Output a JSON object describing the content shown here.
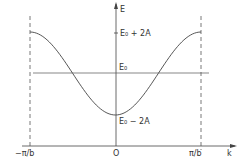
{
  "diagram": {
    "type": "energy-band-dispersion",
    "axes": {
      "y_label": "E",
      "x_label": "k",
      "origin_label": "O",
      "x_ticks": [
        "−π/b",
        "π/b"
      ]
    },
    "levels": {
      "top": "E₀ + 2A",
      "middle": "E₀",
      "bottom": "E₀ − 2A"
    },
    "curve": "E(k) = E₀ − 2A cos(kb)",
    "colors": {
      "line": "#444444",
      "background": "#ffffff"
    }
  },
  "chart_data": {
    "type": "line",
    "title": "",
    "xlabel": "k",
    "ylabel": "E",
    "x_ticks": [
      "−π/b",
      "O",
      "π/b"
    ],
    "y_ticks": [
      "E₀ − 2A",
      "E₀",
      "E₀ + 2A"
    ],
    "series": [
      {
        "name": "E(k) = E₀ − 2A cos(kb)",
        "x": [
          -1,
          -0.75,
          -0.5,
          -0.25,
          0,
          0.25,
          0.5,
          0.75,
          1
        ],
        "x_units": "π/b",
        "y": [
          2,
          1.414,
          0,
          -1.414,
          -2,
          -1.414,
          0,
          1.414,
          2
        ],
        "y_units": "A, relative to E₀"
      },
      {
        "name": "E₀ reference",
        "x": [
          -1,
          1
        ],
        "y": [
          0,
          0
        ]
      }
    ],
    "xlim": [
      -1,
      1
    ],
    "ylim": [
      -2,
      2
    ],
    "grid": false,
    "legend": false
  }
}
